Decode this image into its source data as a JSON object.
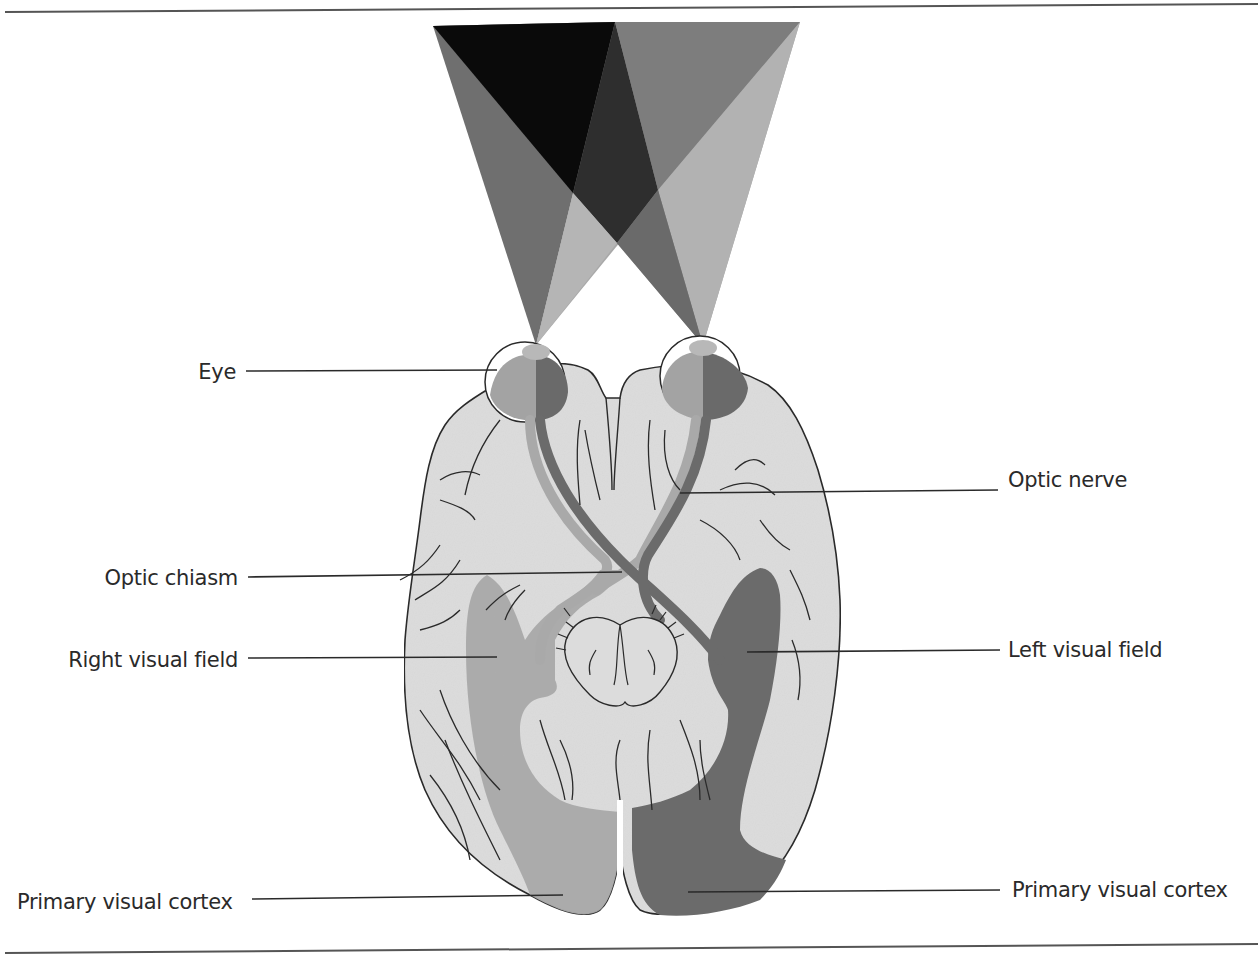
{
  "figure": {
    "title": "",
    "colors": {
      "background": "#ffffff",
      "brain": "#dcdcdc",
      "outline": "#2a2a2a",
      "right_field_light": "#a9a9a9",
      "left_field_dark": "#6b6b6b",
      "overlap_dark": "#2c2c2c",
      "apex_black": "#0a0a0a"
    }
  },
  "labels": {
    "eye": "Eye",
    "optic_nerve": "Optic nerve",
    "optic_chiasm": "Optic chiasm",
    "right_visual_field": "Right visual field",
    "left_visual_field": "Left visual field",
    "primary_visual_cortex_left": "Primary visual cortex",
    "primary_visual_cortex_right": "Primary visual cortex"
  }
}
